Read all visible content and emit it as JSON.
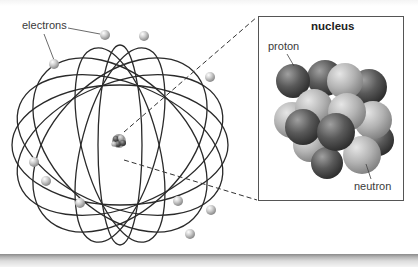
{
  "diagram": {
    "type": "atom-model",
    "labels": {
      "electrons": "electrons",
      "nucleus_title": "nucleus",
      "proton": "proton",
      "neutron": "neutron"
    },
    "components": {
      "electron_count": 14,
      "orbit_count": 8,
      "nucleus_detail": "cluster of protons (dark spheres) and neutrons (light spheres)"
    },
    "colors": {
      "orbit_line": "#2a2a2a",
      "electron": "#c8c8c8",
      "proton": "#555555",
      "neutron": "#a8a8a8",
      "callout_dash": "#333333",
      "box_border": "#555555"
    }
  }
}
